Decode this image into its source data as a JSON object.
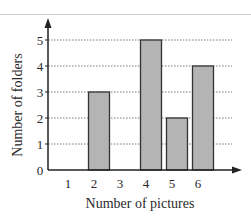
{
  "chart_data": {
    "type": "bar",
    "title": "",
    "xlabel": "Number of pictures",
    "ylabel": "Number of folders",
    "categories": [
      "1",
      "2",
      "3",
      "4",
      "5",
      "6"
    ],
    "values": [
      0,
      3,
      0,
      5,
      2,
      4
    ],
    "ylim": [
      0,
      5
    ],
    "yticks": [
      "0",
      "1",
      "2",
      "3",
      "4",
      "5"
    ],
    "grid": "horizontal dotted",
    "legend": null,
    "bar_color": "#b4b4b4",
    "bar_edge_color": "#333333"
  }
}
